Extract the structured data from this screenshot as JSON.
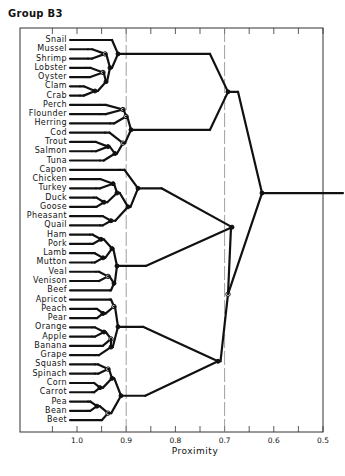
{
  "chart_data": {
    "type": "dendrogram",
    "title": "Group B3",
    "xlabel": "Proximity",
    "ylabel": "",
    "xlim": [
      1.05,
      0.5
    ],
    "x_ticks": [
      1.0,
      0.9,
      0.8,
      0.7,
      0.6,
      0.5
    ],
    "x_tick_labels": [
      "1.0",
      "0.9",
      "0.8",
      "0.7",
      "0.6",
      "0.5"
    ],
    "minor_ticks": [
      1.05,
      0.95,
      0.85,
      0.75,
      0.65,
      0.55
    ],
    "reference_lines": [
      0.9,
      0.7
    ],
    "grid": false,
    "leaves": [
      "Snail",
      "Mussel",
      "Shrimp",
      "Lobster",
      "Oyster",
      "Clam",
      "Crab",
      "Perch",
      "Flounder",
      "Herring",
      "Cod",
      "Trout",
      "Salmon",
      "Tuna",
      "Capon",
      "Chicken",
      "Turkey",
      "Duck",
      "Goose",
      "Pheasant",
      "Quail",
      "Ham",
      "Pork",
      "Lamb",
      "Mutton",
      "Veal",
      "Venison",
      "Beef",
      "Apricot",
      "Peach",
      "Pear",
      "Orange",
      "Apple",
      "Banana",
      "Grape",
      "Squash",
      "Spinach",
      "Corn",
      "Carrot",
      "Pea",
      "Bean",
      "Beet"
    ],
    "clusters": [
      {
        "name": "Shellfish",
        "members": [
          "Snail",
          "Mussel",
          "Shrimp",
          "Lobster",
          "Oyster",
          "Clam",
          "Crab"
        ],
        "join": 0.9
      },
      {
        "name": "Fish",
        "members": [
          "Perch",
          "Flounder",
          "Herring",
          "Cod",
          "Trout",
          "Salmon",
          "Tuna"
        ],
        "join": 0.88
      },
      {
        "name": "Seafood",
        "members": [
          "Shellfish",
          "Fish"
        ],
        "join": 0.72
      },
      {
        "name": "Poultry",
        "members": [
          "Capon",
          "Chicken",
          "Turkey",
          "Duck",
          "Goose",
          "Pheasant",
          "Quail"
        ],
        "join": 0.87
      },
      {
        "name": "Meat",
        "members": [
          "Ham",
          "Pork",
          "Lamb",
          "Mutton",
          "Veal",
          "Venison",
          "Beef"
        ],
        "join": 0.9
      },
      {
        "name": "Meat+Poultry",
        "members": [
          "Poultry",
          "Meat"
        ],
        "join": 0.68
      },
      {
        "name": "Fruit",
        "members": [
          "Apricot",
          "Peach",
          "Pear",
          "Orange",
          "Apple",
          "Banana",
          "Grape"
        ],
        "join": 0.9
      },
      {
        "name": "Vegetables",
        "members": [
          "Squash",
          "Spinach",
          "Corn",
          "Carrot",
          "Pea",
          "Bean",
          "Beet"
        ],
        "join": 0.9
      },
      {
        "name": "Produce",
        "members": [
          "Fruit",
          "Vegetables"
        ],
        "join": 0.74
      },
      {
        "name": "Animal+Produce",
        "members": [
          "Meat+Poultry",
          "Produce"
        ],
        "join": 0.68
      },
      {
        "name": "Root",
        "members": [
          "Seafood",
          "Animal+Produce"
        ],
        "join": 0.63
      }
    ],
    "colors": {
      "line": "#111111",
      "frame": "#333333",
      "reference": "#888888",
      "background": "#ffffff"
    }
  }
}
